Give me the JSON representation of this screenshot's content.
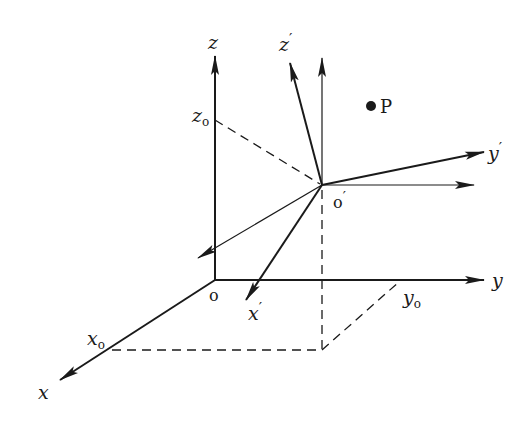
{
  "diagram": {
    "labels": {
      "x": "x",
      "y": "y",
      "z": "z",
      "x_prime": "x",
      "y_prime": "y",
      "z_prime": "z",
      "prime_mark": "′",
      "origin": "o",
      "origin_prime": "o",
      "point": "P",
      "x0_base": "x",
      "y0_base": "y",
      "z0_base": "z",
      "sub_zero": "o"
    },
    "colors": {
      "ink": "#1a1a1a",
      "background": "#ffffff"
    }
  }
}
